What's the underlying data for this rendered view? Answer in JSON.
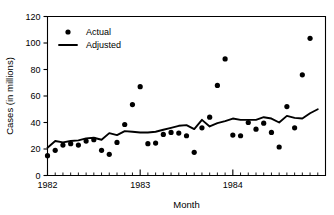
{
  "chart_data": {
    "type": "scatter",
    "title": "",
    "xlabel": "Month",
    "ylabel": "Cases (in millions)",
    "xlim": [
      0,
      36
    ],
    "ylim": [
      0,
      120
    ],
    "yticks": [
      0,
      20,
      40,
      60,
      80,
      100,
      120
    ],
    "xticks_major": [
      0,
      12,
      24
    ],
    "xticklabels_major": [
      "1982",
      "1983",
      "1984"
    ],
    "minor_ticks_per_major": 12,
    "grid": false,
    "legend_position": "upper-left-inside",
    "x": [
      0,
      1,
      2,
      3,
      4,
      5,
      6,
      7,
      8,
      9,
      10,
      11,
      12,
      13,
      14,
      15,
      16,
      17,
      18,
      19,
      20,
      21,
      22,
      23,
      24,
      25,
      26,
      27,
      28,
      29,
      30,
      31,
      32,
      33,
      34,
      35
    ],
    "series": [
      {
        "name": "Actual",
        "marker": "circle",
        "color": "#000000",
        "values": [
          15,
          19,
          23,
          24,
          23,
          26,
          27,
          19,
          16,
          25,
          38.5,
          53.5,
          67,
          24,
          24.5,
          31,
          32.5,
          32,
          30,
          17.5,
          36,
          44,
          68,
          88,
          30.5,
          30,
          40,
          35,
          39.5,
          32.5,
          21.5,
          52,
          36,
          76,
          103.5,
          null
        ]
      },
      {
        "name": "Adjusted",
        "marker": "line",
        "color": "#000000",
        "values": [
          21,
          26,
          25,
          26,
          26.5,
          28,
          28.5,
          27,
          32,
          30.5,
          33.5,
          33,
          32.5,
          32.5,
          33,
          34.5,
          36,
          37.5,
          38,
          35,
          42,
          37,
          39.5,
          41,
          43,
          42,
          42,
          42,
          44,
          43,
          40,
          45,
          43.5,
          43,
          47,
          50
        ]
      }
    ]
  },
  "legend": {
    "items": [
      {
        "label": "Actual",
        "type": "marker"
      },
      {
        "label": "Adjusted",
        "type": "line"
      }
    ]
  },
  "axes": {
    "x_title": "Month",
    "y_title": "Cases (in millions)",
    "y_ticklabels": [
      "0",
      "20",
      "40",
      "60",
      "80",
      "100",
      "120"
    ],
    "x_ticklabels": [
      "1982",
      "1983",
      "1984"
    ]
  }
}
